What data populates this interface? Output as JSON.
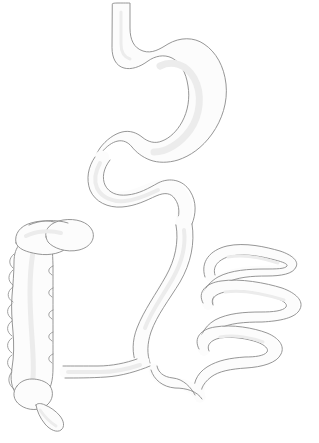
{
  "figure": {
    "background_color": "#ffffff",
    "outline_color": "#8a8a8a",
    "fill_color": "#fcfcfc",
    "shade_color": "#ececec",
    "width": 319,
    "height": 443,
    "caption": ""
  },
  "organs": [
    {
      "id": "esophagus",
      "label": "Esophagus",
      "description": "Narrow vertical tube entering at the top of the frame, descending and curving right into the cardia of the stomach."
    },
    {
      "id": "stomach",
      "label": "Stomach",
      "description": "Large J-shaped sac occupying the upper right; lesser curvature on the left, greater curvature bulging right and down."
    },
    {
      "id": "pylorus",
      "label": "Pylorus",
      "description": "Narrowed outlet at the lower left of the stomach leading into the duodenum."
    },
    {
      "id": "duodenum",
      "label": "Duodenum",
      "description": "S-shaped loop below the stomach that sweeps left, turns down and back to the right."
    },
    {
      "id": "jejunum-ileum",
      "label": "Jejunum and ileum",
      "description": "Serpentine coiled loops of small intestine filling the right-centre and lower right of the frame."
    },
    {
      "id": "ileocecal-junction",
      "label": "Ileocecal junction",
      "description": "Horizontal segment at the lower centre where the ileum joins the cecum."
    },
    {
      "id": "cecum",
      "label": "Cecum",
      "description": "Rounded pouch at the lower left end of the large intestine."
    },
    {
      "id": "appendix",
      "label": "Vermiform appendix",
      "description": "Small narrow finger-like projection hanging down from the cecum at the bottom left."
    },
    {
      "id": "ascending-colon",
      "label": "Ascending colon",
      "description": "Vertical segment on the far left with scalloped haustral pouches along its outer margin."
    },
    {
      "id": "hepatic-flexure",
      "label": "Hepatic flexure",
      "description": "Rounded bend at the top of the ascending colon, drawn as overlapping oval lobes."
    },
    {
      "id": "transverse-colon",
      "label": "Transverse colon",
      "description": "Short oval lobe crossing to the right from the hepatic flexure at the upper left of the colon."
    }
  ]
}
